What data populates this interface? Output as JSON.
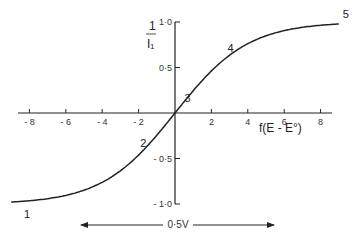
{
  "chart_data": {
    "type": "line",
    "title": "",
    "xlabel": "f(E - E°)",
    "ylabel_num": "1",
    "ylabel_den": "I₁",
    "xlim": [
      -9,
      9
    ],
    "ylim": [
      -1.0,
      1.0
    ],
    "x_ticks": [
      -8,
      -6,
      -4,
      -2,
      2,
      4,
      6,
      8
    ],
    "x_tick_labels": [
      "- 8",
      "- 6",
      "- 4",
      "- 2",
      "2",
      "4",
      "6",
      "8"
    ],
    "y_ticks": [
      1.0,
      0.5,
      -0.5,
      -1.0
    ],
    "y_tick_labels": [
      "1·0",
      "0·5",
      "- 0·5",
      "- 1·0"
    ],
    "grid": false,
    "series": [
      {
        "name": "sigmoid",
        "x": [
          -9,
          -8,
          -6,
          -4,
          -2,
          0,
          2,
          4,
          6,
          8,
          9
        ],
        "y": [
          -0.98,
          -0.96,
          -0.9,
          -0.76,
          -0.46,
          0,
          0.46,
          0.76,
          0.9,
          0.96,
          0.98
        ]
      }
    ],
    "point_labels": [
      {
        "label": "1",
        "x": -8.3,
        "y": -1.0
      },
      {
        "label": "2",
        "x": -1.8,
        "y": -0.4
      },
      {
        "label": "3",
        "x": 0.3,
        "y": 0.05
      },
      {
        "label": "4",
        "x": 3.0,
        "y": 0.6
      },
      {
        "label": "5",
        "x": 9.0,
        "y": 1.0
      }
    ],
    "annotation": {
      "text": "0·5V",
      "type": "double-arrow",
      "x_from": -5.2,
      "x_to": 5.5
    }
  }
}
